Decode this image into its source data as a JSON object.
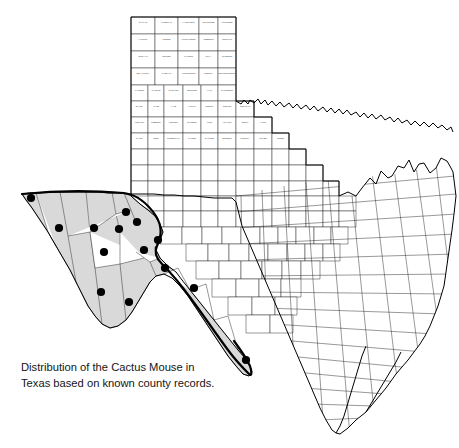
{
  "figure": {
    "caption_line1": "Distribution of the Cactus Mouse in",
    "caption_line2": "Texas based on known county records.",
    "caption_full": "Distribution of the Cactus Mouse in\nTexas based on known county records.",
    "species": "Cactus Mouse",
    "region": "Texas",
    "basis": "known county records"
  },
  "colors": {
    "background": "#ffffff",
    "shaded_range_fill": "#d9d9d9",
    "county_border": "#1a1a1a",
    "state_outline": "#000000",
    "range_boundary": "#000000",
    "record_dot": "#000000",
    "county_label": "#3a3a3a",
    "caption_text": "#151515"
  },
  "map": {
    "type": "choropleth-point-distribution",
    "projection_note": "Texas county outline map",
    "shaded_region_label": "Trans-Pecos and Rio Grande corridor",
    "record_count": 14,
    "records": [
      {
        "name": "El Paso",
        "x": 31,
        "y": 198
      },
      {
        "name": "Hudspeth",
        "x": 59,
        "y": 228
      },
      {
        "name": "Culberson",
        "x": 94,
        "y": 228
      },
      {
        "name": "Reeves",
        "x": 119,
        "y": 229
      },
      {
        "name": "Ward",
        "x": 137,
        "y": 222
      },
      {
        "name": "Jeff Davis",
        "x": 104,
        "y": 252
      },
      {
        "name": "Pecos",
        "x": 144,
        "y": 250
      },
      {
        "name": "Presidio",
        "x": 101,
        "y": 292
      },
      {
        "name": "Brewster",
        "x": 129,
        "y": 302
      },
      {
        "name": "Terrell",
        "x": 165,
        "y": 268
      },
      {
        "name": "Crockett",
        "x": 194,
        "y": 288
      },
      {
        "name": "Val Verde",
        "x": 246,
        "y": 360
      },
      {
        "name": "Loving",
        "x": 126,
        "y": 212
      },
      {
        "name": "Winkler",
        "x": 158,
        "y": 240
      }
    ],
    "panhandle_counties": [
      "DALLAM",
      "SHERMAN",
      "HANSFORD",
      "OCHILTREE",
      "LIPSCOMB",
      "HARTLEY",
      "MOORE",
      "HUTCHINSON",
      "ROBERTS",
      "HEMPHILL",
      "OLDHAM",
      "POTTER",
      "CARSON",
      "GRAY",
      "WHEELER",
      "DEAF SMITH",
      "RANDALL",
      "ARMSTRONG",
      "DONLEY",
      "COLLINGSWORTH",
      "PARMER",
      "CASTRO",
      "SWISHER",
      "BRISCOE",
      "HALL",
      "CHILDRESS",
      "BAILEY",
      "LAMB",
      "HALE",
      "FLOYD",
      "MOTLEY",
      "COTTLE",
      "COCHRAN",
      "HOCKLEY",
      "LUBBOCK",
      "CROSBY",
      "DICKENS",
      "KING",
      "YOAKUM",
      "TERRY",
      "LYNN",
      "GARZA",
      "KENT",
      "STONEWALL",
      "GAINES",
      "DAWSON",
      "BORDEN",
      "SCURRY",
      "FISHER",
      "JONES"
    ],
    "west_texas_counties": [
      "EL PASO",
      "HUDSPETH",
      "CULBERSON",
      "REEVES",
      "LOVING",
      "WINKLER",
      "WARD",
      "JEFF DAVIS",
      "PRESIDIO",
      "BREWSTER",
      "PECOS",
      "TERRELL",
      "CROCKETT",
      "VAL VERDE"
    ]
  }
}
